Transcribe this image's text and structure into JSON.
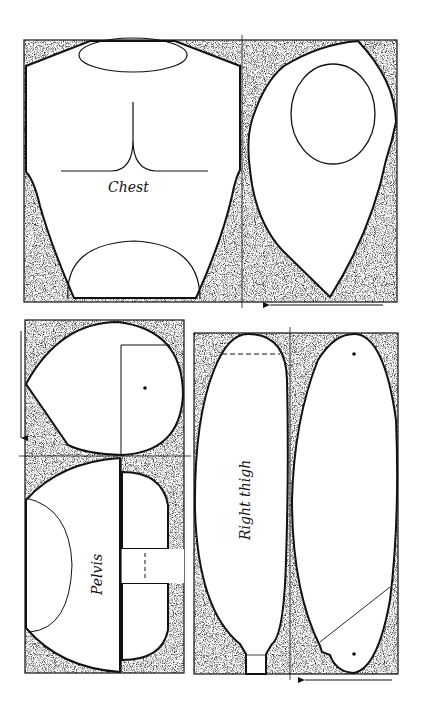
{
  "diagram": {
    "type": "sewing-pattern",
    "colors": {
      "ink": "#111111",
      "fill": "#ffffff",
      "stipple_bg": "#9a9a9a"
    },
    "pieces": [
      {
        "id": "chest",
        "label": "Chest"
      },
      {
        "id": "pelvis",
        "label": "Pelvis"
      },
      {
        "id": "right-thigh",
        "label": "Right thigh"
      }
    ],
    "arrows": [
      {
        "id": "chest-grain-arrow",
        "direction": "left"
      },
      {
        "id": "pelvis-grain-arrow",
        "direction": "down"
      },
      {
        "id": "thigh-grain-arrow",
        "direction": "left"
      }
    ]
  }
}
